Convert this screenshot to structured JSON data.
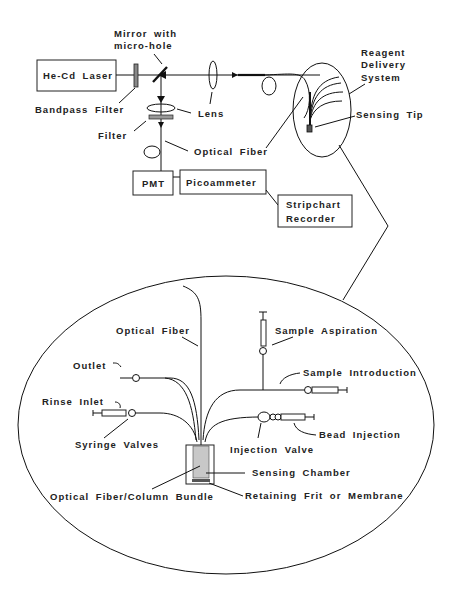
{
  "diagram": {
    "optical_setup": {
      "laser": "He-Cd Laser",
      "bandpass_filter": "Bandpass Filter",
      "mirror_line1": "Mirror with",
      "mirror_line2": "micro-hole",
      "lens": "Lens",
      "filter": "Filter",
      "optical_fiber": "Optical Fiber",
      "pmt": "PMT",
      "picoammeter": "Picoammeter",
      "recorder_line1": "Stripchart",
      "recorder_line2": "Recorder"
    },
    "tip_inset": {
      "reagent_line1": "Reagent",
      "reagent_line2": "Delivery",
      "reagent_line3": "System",
      "sensing_tip": "Sensing Tip"
    },
    "detail_view": {
      "optical_fiber": "Optical Fiber",
      "sample_aspiration": "Sample Aspiration",
      "outlet": "Outlet",
      "sample_introduction": "Sample Introduction",
      "rinse_inlet": "Rinse Inlet",
      "bead_injection": "Bead Injection",
      "syringe_valves": "Syringe Valves",
      "injection_valve": "Injection Valve",
      "sensing_chamber": "Sensing Chamber",
      "bundle": "Optical Fiber/Column Bundle",
      "frit": "Retaining Frit or Membrane"
    },
    "colors": {
      "line": "#111111",
      "chamber_fill": "#c8c8c8",
      "text": "#222222"
    }
  }
}
